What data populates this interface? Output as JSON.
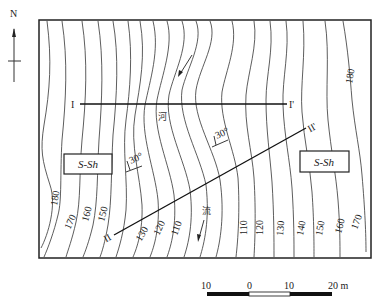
{
  "north_arrow": {
    "label": "N"
  },
  "sections": [
    {
      "start": "I",
      "end": "I'"
    },
    {
      "start": "II",
      "end": "II'"
    }
  ],
  "formation_boxes": [
    {
      "label": "S-Sh"
    },
    {
      "label": "S-Sh"
    }
  ],
  "river": {
    "char1": "河",
    "char2": "流"
  },
  "dip_labels": [
    "30°",
    "30°"
  ],
  "contour_labels": {
    "left": [
      "180",
      "170",
      "160",
      "150"
    ],
    "center_left": [
      "130",
      "120",
      "110"
    ],
    "center_right": [
      "110",
      "120",
      "130",
      "140",
      "150",
      "160",
      "170"
    ],
    "top_right": "180"
  },
  "scale_bar": {
    "ticks": [
      "10",
      "0",
      "10",
      "20 m"
    ]
  }
}
